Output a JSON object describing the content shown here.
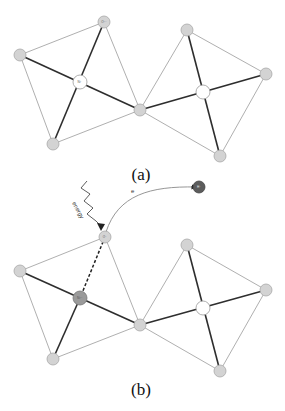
{
  "figure": {
    "panels": [
      {
        "id": "a",
        "caption": "(a)",
        "nodes": {
          "top": {
            "label": "O²⁻"
          },
          "center_left": {
            "label": "Ni⁺"
          }
        }
      },
      {
        "id": "b",
        "caption": "(b)",
        "nodes": {
          "top": {
            "label": "O⁻"
          },
          "center_left": {
            "label": "Ni²⁺"
          },
          "ejected": {
            "label": "H⁺"
          }
        },
        "annotations": {
          "energy_label": "energy",
          "electron_label": "e"
        }
      }
    ],
    "colors": {
      "thin_edge": "#9a9a9a",
      "thick_edge": "#2e2e2e",
      "node_fill": "#d3d3d3",
      "node_center": "#ffffff",
      "node_ni_b": "#9a9a9a",
      "node_ejected": "#5c5c5c"
    }
  }
}
